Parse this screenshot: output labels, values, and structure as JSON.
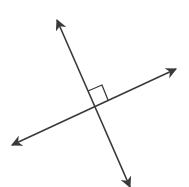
{
  "diagram": {
    "title": "",
    "colors": {
      "background": "#ffffff",
      "stroke": "#3a3a3a"
    },
    "stroke_width": 1.6,
    "lines": [
      {
        "name": "line-steep",
        "x1": 57,
        "y1": 20,
        "x2": 130,
        "y2": 187,
        "arrowheads": [
          "start",
          "end"
        ]
      },
      {
        "name": "line-shallow",
        "x1": 12,
        "y1": 145,
        "x2": 176,
        "y2": 69,
        "arrowheads": [
          "start",
          "end"
        ]
      }
    ],
    "intersection": {
      "x": 94,
      "y": 107
    },
    "right_angle_marker": {
      "points": "88,91 102,85 108,100"
    }
  }
}
